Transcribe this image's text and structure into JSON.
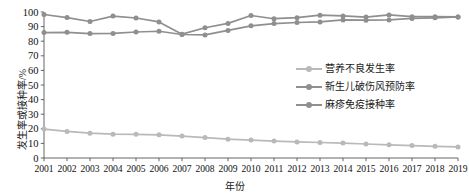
{
  "chart_data": {
    "type": "line",
    "title": "",
    "xlabel": "年份",
    "ylabel": "发生率或接种率/%",
    "xlim": [
      2001,
      2019
    ],
    "ylim": [
      0,
      100
    ],
    "ytick_step": 10,
    "grid": false,
    "legend_position": "right-middle",
    "categories": [
      "2001",
      "2002",
      "2003",
      "2004",
      "2005",
      "2006",
      "2007",
      "2008",
      "2009",
      "2010",
      "2011",
      "2012",
      "2013",
      "2014",
      "2015",
      "2016",
      "2017",
      "2018",
      "2019"
    ],
    "yticks": [
      "0",
      "10",
      "20",
      "30",
      "40",
      "50",
      "60",
      "70",
      "80",
      "90",
      "100"
    ],
    "series": [
      {
        "name": "营养不良发生率",
        "color": "#b9b9b9",
        "marker": "circle",
        "values": [
          19.8,
          18.2,
          17.0,
          16.3,
          16.2,
          15.9,
          15.0,
          14.0,
          12.9,
          12.3,
          11.6,
          11.0,
          10.6,
          10.2,
          9.6,
          9.0,
          8.5,
          8.0,
          7.6
        ]
      },
      {
        "name": "新生儿破伤风预防率",
        "color": "#8f8f8f",
        "marker": "circle",
        "values": [
          85.9,
          86.1,
          85.2,
          85.3,
          86.3,
          86.8,
          84.6,
          84.3,
          87.4,
          90.5,
          92.1,
          92.8,
          93.2,
          94.6,
          94.4,
          94.6,
          95.6,
          96.0,
          96.6
        ]
      },
      {
        "name": "麻疹免疫接种率",
        "color": "#8f8f8f",
        "marker": "circle",
        "values": [
          98.3,
          96.2,
          93.5,
          97.2,
          95.9,
          93.2,
          84.8,
          89.2,
          92.2,
          97.6,
          95.4,
          96.1,
          97.8,
          97.3,
          96.5,
          98.0,
          96.8,
          96.8,
          96.6
        ]
      }
    ]
  },
  "legend": {
    "items": [
      {
        "label": "营养不良发生率"
      },
      {
        "label": "新生儿破伤风预防率"
      },
      {
        "label": "麻疹免疫接种率"
      }
    ]
  },
  "axes": {
    "y_axis_title": "发生率或接种率/%",
    "x_axis_title": "年份"
  }
}
